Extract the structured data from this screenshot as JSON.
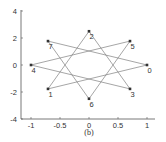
{
  "chart_data": {
    "type": "line",
    "title": "",
    "caption": "(b)",
    "xlabel": "",
    "ylabel": "",
    "xlim": [
      -1.1,
      1.1
    ],
    "ylim": [
      -4,
      4.5
    ],
    "x_ticks": [
      -1,
      -0.5,
      0,
      0.5,
      1
    ],
    "x_tick_labels": [
      "-1",
      "-0.5",
      "0",
      "0.5",
      "1"
    ],
    "y_ticks": [
      -4,
      -2,
      0,
      2,
      4
    ],
    "y_tick_labels": [
      "-4",
      "-2",
      "0",
      "2",
      "4"
    ],
    "grid": false,
    "legend": null,
    "points": [
      {
        "label": "0",
        "x": 1.0,
        "y": 0.0
      },
      {
        "label": "1",
        "x": -0.707,
        "y": -1.77
      },
      {
        "label": "2",
        "x": 0.0,
        "y": 2.5
      },
      {
        "label": "3",
        "x": 0.707,
        "y": -1.77
      },
      {
        "label": "4",
        "x": -1.0,
        "y": 0.0
      },
      {
        "label": "5",
        "x": 0.707,
        "y": 1.77
      },
      {
        "label": "6",
        "x": 0.0,
        "y": -2.5
      },
      {
        "label": "7",
        "x": -0.707,
        "y": 1.77
      }
    ],
    "path_order": [
      0,
      1,
      2,
      3,
      4,
      5,
      6,
      7,
      0
    ],
    "series": [
      {
        "name": "star-polygon",
        "x": [
          1.0,
          -0.707,
          0.0,
          0.707,
          -1.0,
          0.707,
          0.0,
          -0.707,
          1.0
        ],
        "y": [
          0.0,
          -1.77,
          2.5,
          -1.77,
          0.0,
          1.77,
          -2.5,
          1.77,
          0.0
        ]
      }
    ],
    "colors": {
      "line": "#808080",
      "marker": "#333333",
      "axis": "#555555"
    }
  }
}
